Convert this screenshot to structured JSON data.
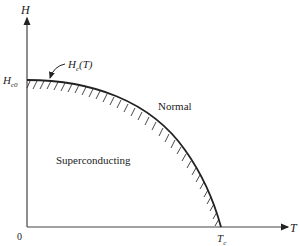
{
  "diagram": {
    "type": "phase-diagram",
    "axes": {
      "y_label": "H",
      "x_label": "T",
      "origin_label": "0",
      "y_intercept_label": "H",
      "y_intercept_sub": "c0",
      "x_intercept_label": "T",
      "x_intercept_sub": "c"
    },
    "curve": {
      "label_main": "H",
      "label_sub": "c",
      "label_arg": "(T)"
    },
    "regions": {
      "upper": "Normal",
      "lower": "Superconducting"
    },
    "colors": {
      "line": "#222222",
      "axis": "#444444",
      "background": "#ffffff"
    }
  }
}
